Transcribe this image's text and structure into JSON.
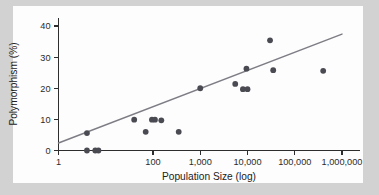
{
  "figure": {
    "background_color": "#d2d2d2",
    "plot_background_color": "#fdfdfd",
    "marker_color": "#4a4a52",
    "line_color": "#7d7d85",
    "axis_color": "#2d2d2d"
  },
  "chart_data": {
    "type": "scatter",
    "title": "",
    "xlabel": "Population Size (log)",
    "ylabel": "Polymorphism (%)",
    "xscale": "log",
    "yscale": "linear",
    "xlim": [
      1,
      3000000
    ],
    "ylim": [
      -2,
      43
    ],
    "grid": false,
    "legend": null,
    "xticks": [
      1,
      100,
      1000,
      10000,
      100000,
      1000000
    ],
    "xticklabels": [
      "1",
      "100",
      "1,000",
      "10,000",
      "100,000",
      "1,000,000"
    ],
    "yticks": [
      0,
      10,
      20,
      30,
      40
    ],
    "yticklabels": [
      "0",
      "10",
      "20",
      "30",
      "40"
    ],
    "points": [
      {
        "x": 4,
        "y": 5.6
      },
      {
        "x": 4,
        "y": 0.0
      },
      {
        "x": 6,
        "y": 0.0
      },
      {
        "x": 7,
        "y": 0.0
      },
      {
        "x": 40,
        "y": 9.9
      },
      {
        "x": 70,
        "y": 6.0
      },
      {
        "x": 95,
        "y": 9.9
      },
      {
        "x": 110,
        "y": 9.9
      },
      {
        "x": 150,
        "y": 9.7
      },
      {
        "x": 350,
        "y": 6.0
      },
      {
        "x": 1000,
        "y": 20.0
      },
      {
        "x": 5500,
        "y": 21.4
      },
      {
        "x": 8000,
        "y": 19.7
      },
      {
        "x": 10000,
        "y": 19.7
      },
      {
        "x": 9500,
        "y": 26.3
      },
      {
        "x": 30000,
        "y": 35.4
      },
      {
        "x": 35000,
        "y": 25.8
      },
      {
        "x": 400000,
        "y": 25.6
      }
    ],
    "trendline": {
      "type": "linear-fit-on-log-x",
      "x_start": 1,
      "y_start": 2.4,
      "x_end": 1000000,
      "y_end": 37.4
    }
  },
  "axes": {
    "x_title": "Population Size (log)",
    "y_title": "Polymorphism (%)"
  }
}
